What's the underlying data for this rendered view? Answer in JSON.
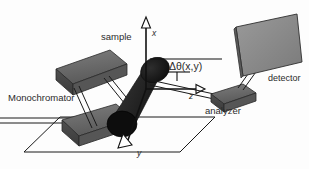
{
  "figure": {
    "background_color": "#fdfdfd",
    "line_color": "#1a1a1a",
    "block_fill": "#6e6e6e",
    "block_fill_dark": "#4a4a4a",
    "detector_fill": "#8a8a8a",
    "sample_fill": "#1d1d1d"
  },
  "labels": {
    "sample": "sample",
    "monochromator": "Monochromator",
    "analyzer": "analyzer",
    "detector": "detector",
    "delta_theta": "Δθ(x,y)",
    "axis_x": "x",
    "axis_y": "y",
    "axis_z": "z"
  },
  "components": [
    {
      "name": "monochromator-block-upper",
      "label": "Monochromator",
      "shape": "slab"
    },
    {
      "name": "monochromator-block-lower",
      "label": "Monochromator",
      "shape": "slab"
    },
    {
      "name": "sample-cylinder",
      "label": "sample",
      "shape": "cylinder"
    },
    {
      "name": "analyzer-block",
      "label": "analyzer",
      "shape": "slab"
    },
    {
      "name": "detector-panel",
      "label": "detector",
      "shape": "panel"
    },
    {
      "name": "ground-parallelogram",
      "label": "",
      "shape": "outline"
    }
  ],
  "axes": {
    "x": {
      "label": "x",
      "direction": "up"
    },
    "y": {
      "label": "y",
      "direction": "down-left"
    },
    "z": {
      "label": "z",
      "direction": "right"
    }
  },
  "annotations": [
    {
      "name": "scattering-angle",
      "text": "Δθ(x,y)"
    }
  ]
}
